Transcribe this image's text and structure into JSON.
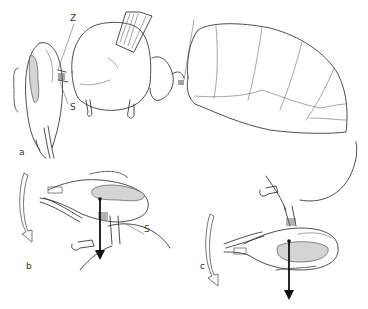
{
  "figure": {
    "panels": [
      {
        "id": "a",
        "label": "a",
        "description": "Lateral view of whole insect (head, thorax with wing base, segmented abdomen)"
      },
      {
        "id": "b",
        "label": "b",
        "description": "Head-thorax articulation, head rotated with downward force arrow"
      },
      {
        "id": "c",
        "label": "c",
        "description": "Head-thorax articulation, alternate head position with downward force arrow"
      }
    ],
    "annotations": [
      {
        "panel": "a",
        "text": "Z"
      },
      {
        "panel": "a",
        "text": "S"
      },
      {
        "panel": "b",
        "text": "S"
      }
    ],
    "colors": {
      "line": "#3a3a3a",
      "arrow": "#111111",
      "background": "#ffffff"
    }
  }
}
